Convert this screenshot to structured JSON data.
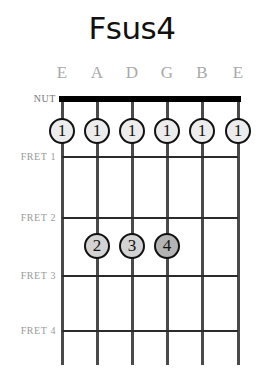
{
  "chord": {
    "title": "Fsus4",
    "nut_label": "NUT",
    "string_labels": [
      "E",
      "A",
      "D",
      "G",
      "B",
      "E"
    ],
    "fret_labels": [
      "FRET 1",
      "FRET 2",
      "FRET 3",
      "FRET 4"
    ],
    "colors": {
      "background": "#ffffff",
      "nut": "#000000",
      "fret_line": "#2b2b2b",
      "string_line": "#4a4a4a",
      "label_text": "#a9a9a9",
      "dot_light_fill": "#ececec",
      "dot_mid_fill": "#d3d3d3",
      "dot_dark_fill": "#b3b3b3",
      "dot_border": "#111111",
      "title_text": "#111111"
    },
    "dots": [
      {
        "label": "1",
        "string": "E",
        "string_index": 1,
        "fret": 1,
        "shade": "light"
      },
      {
        "label": "1",
        "string": "A",
        "string_index": 2,
        "fret": 1,
        "shade": "light"
      },
      {
        "label": "1",
        "string": "D",
        "string_index": 3,
        "fret": 1,
        "shade": "light"
      },
      {
        "label": "1",
        "string": "G",
        "string_index": 4,
        "fret": 1,
        "shade": "light"
      },
      {
        "label": "1",
        "string": "B",
        "string_index": 5,
        "fret": 1,
        "shade": "light"
      },
      {
        "label": "1",
        "string": "E",
        "string_index": 6,
        "fret": 1,
        "shade": "light"
      },
      {
        "label": "2",
        "string": "A",
        "string_index": 2,
        "fret": 3,
        "shade": "mid"
      },
      {
        "label": "3",
        "string": "D",
        "string_index": 3,
        "fret": 3,
        "shade": "mid"
      },
      {
        "label": "4",
        "string": "G",
        "string_index": 4,
        "fret": 3,
        "shade": "dark"
      }
    ]
  }
}
